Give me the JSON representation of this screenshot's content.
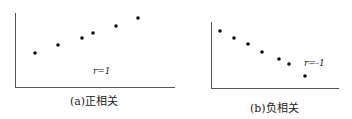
{
  "chart_data": [
    {
      "type": "scatter",
      "title": "",
      "caption": "(a)正相关",
      "annotation": "r=1",
      "xlabel": "",
      "ylabel": "",
      "grid": false,
      "points": [
        [
          35,
          53
        ],
        [
          58,
          45
        ],
        [
          82,
          38
        ],
        [
          93,
          33
        ],
        [
          116,
          26
        ],
        [
          138,
          18
        ]
      ]
    },
    {
      "type": "scatter",
      "title": "",
      "caption": "(b)负相关",
      "annotation": "r=-1",
      "xlabel": "",
      "ylabel": "",
      "grid": false,
      "points": [
        [
          220,
          31
        ],
        [
          234,
          38
        ],
        [
          248,
          44
        ],
        [
          262,
          52
        ],
        [
          279,
          59
        ],
        [
          289,
          64
        ],
        [
          305,
          76
        ]
      ]
    }
  ]
}
